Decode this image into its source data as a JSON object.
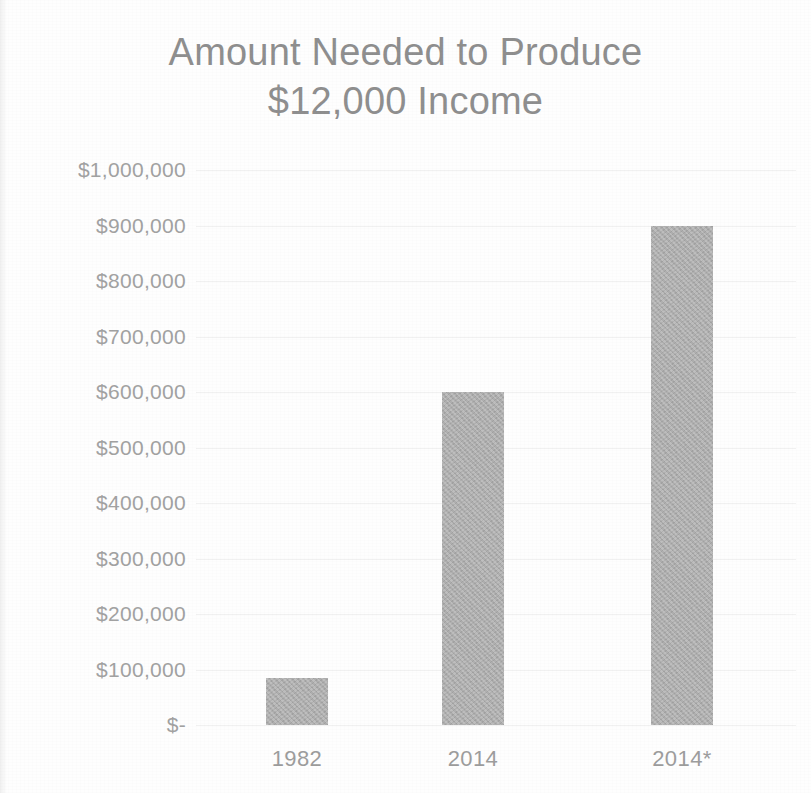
{
  "chart_data": {
    "type": "bar",
    "title": "Amount Needed to Produce $12,000 Income",
    "title_lines": [
      "Amount Needed to Produce",
      "$12,000 Income"
    ],
    "xlabel": "",
    "ylabel": "",
    "categories": [
      "1982",
      "2014",
      "2014*"
    ],
    "values": [
      85000,
      600000,
      900000
    ],
    "ylim": [
      0,
      1000000
    ],
    "ytick_values": [
      1000000,
      900000,
      800000,
      700000,
      600000,
      500000,
      400000,
      300000,
      200000,
      100000,
      0
    ],
    "ytick_labels": [
      "$1,000,000",
      "$900,000",
      "$800,000",
      "$700,000",
      "$600,000",
      "$500,000",
      "$400,000",
      "$300,000",
      "$200,000",
      "$100,000",
      "$-"
    ],
    "grid": true,
    "legend": false,
    "legend_position": "none",
    "bar_color": "#b2b2b2",
    "text_color": "#9d9d9d",
    "title_color": "#8f8f8f",
    "background_color": "#fefefe"
  }
}
